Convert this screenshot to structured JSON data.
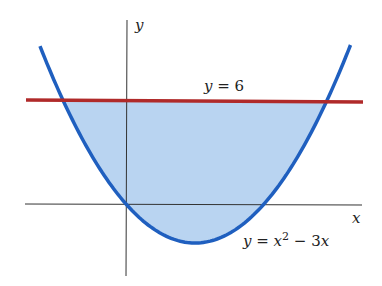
{
  "chart_data": {
    "type": "area",
    "title": "",
    "xlabel": "x",
    "ylabel": "y",
    "series": [
      {
        "name": "y = x^2 - 3x",
        "kind": "curve",
        "color": "#1f5fbf",
        "x": [
          -1.87,
          -1.372,
          0,
          1.5,
          3,
          4.372,
          4.9
        ],
        "y": [
          9.1,
          6,
          0,
          -2.25,
          0,
          6,
          9.31
        ]
      },
      {
        "name": "y = 6",
        "kind": "line",
        "color": "#b02a2a",
        "x": [
          -2.2,
          5.1
        ],
        "y": [
          6,
          6
        ]
      }
    ],
    "shaded_region": {
      "between": [
        "y = x^2 - 3x",
        "y = 6"
      ],
      "x_range": [
        -1.372,
        4.372
      ],
      "color": "#b9d4f1"
    },
    "xlim": [
      -2.2,
      5.1
    ],
    "ylim": [
      -4.2,
      10.5
    ],
    "grid": false,
    "legend": "none"
  },
  "labels": {
    "x_axis": "x",
    "y_axis": "y",
    "line_label_var": "y",
    "line_label_eq": " = 6",
    "curve_label_var": "y",
    "curve_label_eq": " = ",
    "curve_label_x": "x",
    "curve_label_exp": "2",
    "curve_label_rest": " − 3",
    "curve_label_x2": "x"
  }
}
